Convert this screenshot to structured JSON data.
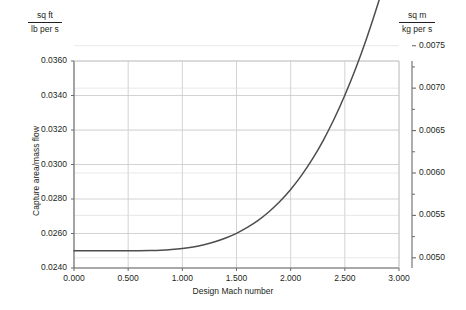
{
  "chart_data": {
    "type": "line",
    "title": "",
    "xlabel": "Design Mach number",
    "ylabel": "Capture area/mass flow",
    "left_axis": {
      "unit_numerator": "sq ft",
      "unit_denominator": "lb per s",
      "ticks": [
        "0.0240",
        "0.0260",
        "0.0280",
        "0.0300",
        "0.0320",
        "0.0340",
        "0.0360"
      ],
      "tick_values": [
        0.024,
        0.026,
        0.028,
        0.03,
        0.032,
        0.034,
        0.036
      ],
      "ylim": [
        0.024,
        0.036
      ]
    },
    "right_axis": {
      "unit_numerator": "sq m",
      "unit_denominator": "kg per s",
      "ticks": [
        "0.0050",
        "0.0055",
        "0.0060",
        "0.0065",
        "0.0070",
        "0.0075"
      ],
      "tick_values": [
        0.005,
        0.0055,
        0.006,
        0.0065,
        0.007,
        0.0075
      ],
      "ylim": [
        0.00488,
        0.00732
      ]
    },
    "x_axis": {
      "ticks": [
        "0.000",
        "0.500",
        "1.000",
        "1.500",
        "2.000",
        "2.500",
        "3.000"
      ],
      "tick_values": [
        0.0,
        0.5,
        1.0,
        1.5,
        2.0,
        2.5,
        3.0
      ],
      "xlim": [
        0.0,
        3.0
      ]
    },
    "grid": true,
    "legend": "none",
    "series": [
      {
        "name": "Capture area/mass flow",
        "color": "#4d4d4d",
        "x": [
          0.0,
          0.1,
          0.2,
          0.3,
          0.4,
          0.5,
          0.6,
          0.7,
          0.8,
          0.9,
          1.0,
          1.1,
          1.2,
          1.3,
          1.4,
          1.5,
          1.6,
          1.7,
          1.8,
          1.9,
          2.0,
          2.1,
          2.2,
          2.3,
          2.4,
          2.5,
          2.6,
          2.7,
          2.8,
          2.9,
          3.0
        ],
        "values": [
          0.025,
          0.025,
          0.025,
          0.025,
          0.025,
          0.025,
          0.025,
          0.02501,
          0.02503,
          0.02507,
          0.02513,
          0.02522,
          0.02535,
          0.02552,
          0.02574,
          0.02601,
          0.02635,
          0.02676,
          0.02726,
          0.02785,
          0.02855,
          0.02937,
          0.03031,
          0.03139,
          0.03262,
          0.03401,
          0.03556,
          0.03729,
          0.0392,
          0.0413,
          0.0436
        ]
      }
    ]
  }
}
